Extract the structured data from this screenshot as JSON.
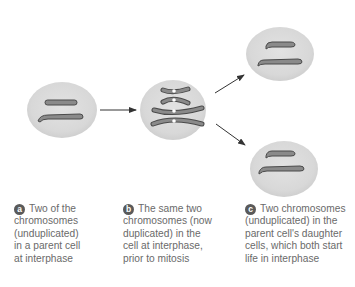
{
  "diagram": {
    "title": "",
    "colors": {
      "cell_fill": "#dcdcdc",
      "chromosome_fill": "#8a8a8a",
      "chromosome_stroke": "#4a4a4a",
      "arrow": "#333333",
      "caption_text": "#6a6a6a",
      "badge_fill": "#5a5a5a"
    },
    "nodes": [
      {
        "id": "a",
        "type": "cell",
        "state": "parent cell at interphase, 2 unduplicated chromosomes"
      },
      {
        "id": "b",
        "type": "cell",
        "state": "interphase, 2 duplicated chromosomes"
      },
      {
        "id": "c1",
        "type": "cell",
        "state": "daughter cell, 2 unduplicated chromosomes"
      },
      {
        "id": "c2",
        "type": "cell",
        "state": "daughter cell, 2 unduplicated chromosomes"
      }
    ],
    "edges": [
      {
        "from": "a",
        "to": "b"
      },
      {
        "from": "b",
        "to": "c1"
      },
      {
        "from": "b",
        "to": "c2"
      }
    ]
  },
  "captions": [
    {
      "badge": "a",
      "lines": [
        "Two of the",
        "chromosomes",
        "(unduplicated)",
        "in a parent cell",
        "at interphase"
      ]
    },
    {
      "badge": "b",
      "lines": [
        "The same two",
        "chromosomes (now",
        "duplicated) in the",
        "cell at interphase,",
        "prior to mitosis"
      ]
    },
    {
      "badge": "c",
      "lines": [
        "Two chromosomes",
        "(unduplicated) in the",
        "parent cell's daughter",
        "cells, which both start",
        "life in interphase"
      ]
    }
  ]
}
